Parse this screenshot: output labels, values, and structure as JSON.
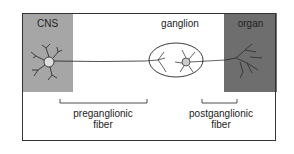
{
  "labels": {
    "cns": "CNS",
    "ganglion": "ganglion",
    "organ": "organ",
    "pre_line1": "preganglionic",
    "pre_line2": "fiber",
    "post_line1": "postganglionic",
    "post_line2": "fiber"
  },
  "colors": {
    "cns_fill": "#a6a6a6",
    "organ_fill": "#6e6e6e",
    "line": "#222222"
  }
}
